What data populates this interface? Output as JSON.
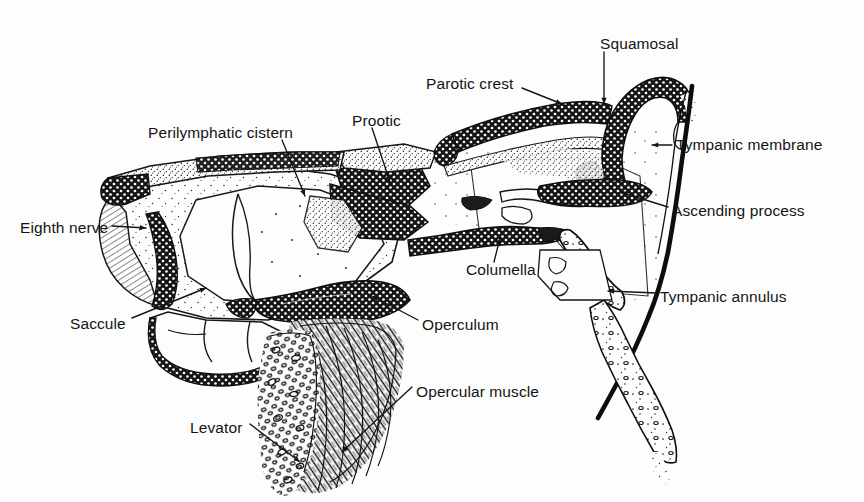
{
  "figure": {
    "background_color": "#fdfdfd",
    "ink_color": "#141414",
    "width": 864,
    "height": 502
  },
  "labels": [
    {
      "id": "squamosal",
      "text": "Squamosal",
      "x": 600,
      "y": 44,
      "align": "left",
      "leader": "M 604 52 L 604 104"
    },
    {
      "id": "parotic-crest",
      "text": "Parotic crest",
      "x": 426,
      "y": 84,
      "align": "left",
      "leader": "M 522 88 L 562 104"
    },
    {
      "id": "perilymphatic",
      "text": "Perilymphatic cistern",
      "x": 148,
      "y": 133,
      "align": "left",
      "leader": "M 282 140 L 305 196"
    },
    {
      "id": "prootic",
      "text": "Prootic",
      "x": 352,
      "y": 121,
      "align": "left",
      "leader": "M 372 128 L 390 182"
    },
    {
      "id": "tympanic-membrane",
      "text": "Tympanic membrane",
      "x": 676,
      "y": 145,
      "align": "left",
      "leader": "M 672 145 L 652 145"
    },
    {
      "id": "ascending-process",
      "text": "Ascending process",
      "x": 672,
      "y": 211,
      "align": "left",
      "leader": "M 668 207 L 620 192"
    },
    {
      "id": "eighth-nerve",
      "text": "Eighth nerve",
      "x": 20,
      "y": 228,
      "align": "left",
      "leader": "M 112 226 L 146 228"
    },
    {
      "id": "columella",
      "text": "Columella",
      "x": 466,
      "y": 270,
      "align": "left",
      "leader": "M 494 262 L 500 238"
    },
    {
      "id": "tympanic-annulus",
      "text": "Tympanic annulus",
      "x": 660,
      "y": 297,
      "align": "left",
      "leader": "M 656 293 L 608 291"
    },
    {
      "id": "saccule",
      "text": "Saccule",
      "x": 70,
      "y": 324,
      "align": "left",
      "leader": "M 132 318 L 206 288"
    },
    {
      "id": "operculum",
      "text": "Operculum",
      "x": 422,
      "y": 325,
      "align": "left",
      "leader": "M 418 320 L 372 296"
    },
    {
      "id": "opercular-muscle",
      "text": "Opercular muscle",
      "x": 416,
      "y": 392,
      "align": "left",
      "leader": "M 412 387 L 342 452"
    },
    {
      "id": "levator",
      "text": "Levator",
      "x": 190,
      "y": 428,
      "align": "left",
      "leader": "M 250 424 L 300 462"
    }
  ],
  "structures": [
    {
      "name": "squamosal-bone",
      "fill": "stipple-dark",
      "note": "hook-shaped bone upper right"
    },
    {
      "name": "parotic-crest-bone",
      "fill": "stipple-dark",
      "note": "elongated horizontal bone"
    },
    {
      "name": "prootic-bone",
      "fill": "stipple-dark",
      "note": "central bone mass"
    },
    {
      "name": "otic-capsule",
      "fill": "stipple-light",
      "note": "large left chamber"
    },
    {
      "name": "perilymphatic-cistern",
      "fill": "clear",
      "note": "open cavity in capsule"
    },
    {
      "name": "saccule-chamber",
      "fill": "clear",
      "note": "lower left cavity"
    },
    {
      "name": "eighth-nerve-trunk",
      "fill": "hatch",
      "note": "nerve at left margin"
    },
    {
      "name": "columella-shaft",
      "fill": "stipple-dark",
      "note": "rod spanning to annulus"
    },
    {
      "name": "operculum-plate",
      "fill": "stipple-dark",
      "note": "dark plate above muscle"
    },
    {
      "name": "opercular-muscle",
      "fill": "fiber-hatch",
      "note": "striated muscle mass"
    },
    {
      "name": "levator-muscle",
      "fill": "cell-ovals",
      "note": "oval fiber cross-sections"
    },
    {
      "name": "tympanic-membrane",
      "fill": "solid-line",
      "note": "thick dark line at right"
    },
    {
      "name": "ascending-process",
      "fill": "stipple-dark",
      "note": "dark bar below cavity"
    },
    {
      "name": "tympanic-annulus",
      "fill": "stipple-dark",
      "note": "ring cartilage lower right"
    },
    {
      "name": "annulus-tail",
      "fill": "stipple-light",
      "note": "descending tapered tail"
    },
    {
      "name": "middle-ear-cavity",
      "fill": "stipple-sparse",
      "note": "large right air cavity"
    }
  ]
}
